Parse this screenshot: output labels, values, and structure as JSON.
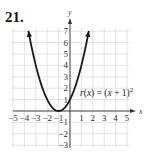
{
  "problem": {
    "number": "21."
  },
  "chart_data": {
    "type": "line",
    "title": "",
    "function_label": "r(x) = (x + 1)",
    "function_exponent": "2",
    "xlabel": "x",
    "ylabel": "y",
    "xlim": [
      -5,
      5
    ],
    "ylim": [
      -3,
      7
    ],
    "x_ticks": [
      "-5",
      "-4",
      "-3",
      "-2",
      "-1",
      "1",
      "2",
      "3",
      "4",
      "5"
    ],
    "y_ticks": [
      "7",
      "6",
      "5",
      "4",
      "3",
      "2",
      "1",
      "-1",
      "-2",
      "-3"
    ],
    "grid": true,
    "series": [
      {
        "name": "r(x) = (x + 1)^2",
        "x": [
          -3.65,
          -3,
          -2,
          -1,
          0,
          1,
          1.65
        ],
        "y": [
          7,
          4,
          1,
          0,
          1,
          4,
          7
        ],
        "arrows_at_ends": true
      }
    ],
    "vertex": [
      -1,
      0
    ],
    "colors": {
      "curve": "#1a1a1a",
      "grid": "#d9d9d9",
      "axis": "#333333"
    }
  }
}
